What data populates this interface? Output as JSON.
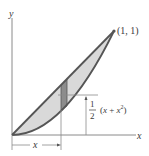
{
  "diagram": {
    "axes": {
      "x_label": "x",
      "y_label": "y"
    },
    "point_label": "(1, 1)",
    "upper_curve": "y = x",
    "lower_curve": "y = x^2",
    "strip": {
      "centroid_fraction_num": "1",
      "centroid_fraction_den": "2",
      "centroid_expr_open": "(",
      "centroid_expr_x": "x",
      "centroid_expr_plus": " + ",
      "centroid_expr_x2": "x",
      "centroid_expr_sup": "2",
      "centroid_expr_close": ")"
    },
    "dimension_label": "x",
    "colors": {
      "region_fill": "#d9d9d9",
      "strip_fill": "#8c8c8c",
      "curve_stroke": "#555555",
      "axis_stroke": "#8a8a8a"
    }
  }
}
